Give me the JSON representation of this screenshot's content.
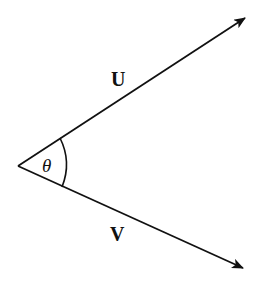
{
  "diagram": {
    "type": "vector-angle",
    "vertex": {
      "x": 18,
      "y": 166
    },
    "vectors": [
      {
        "name": "U",
        "label": "U",
        "tip": {
          "x": 246,
          "y": 17
        },
        "label_pos": {
          "x": 118,
          "y": 86
        }
      },
      {
        "name": "V",
        "label": "V",
        "tip": {
          "x": 244,
          "y": 269
        },
        "label_pos": {
          "x": 118,
          "y": 241
        }
      }
    ],
    "angle": {
      "label": "θ",
      "label_pos": {
        "x": 50,
        "y": 173
      }
    },
    "stroke_color": "#111111",
    "background": "#ffffff"
  }
}
